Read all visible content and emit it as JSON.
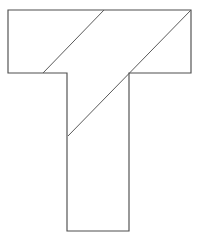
{
  "figure": {
    "canvas": {
      "width": 200,
      "height": 243,
      "background_color": "#ffffff"
    },
    "colors": {
      "outline_stroke": "#4f4f4f",
      "cut_stroke": "#5a5a5a",
      "fill": "#ffffff"
    },
    "outline": {
      "name": "t-polygon",
      "points": "8,10 191,10 191,73 129,73 129,231 67,231 67,73 8,73",
      "vertices": [
        [
          8,
          10
        ],
        [
          191,
          10
        ],
        [
          191,
          73
        ],
        [
          129,
          73
        ],
        [
          129,
          231
        ],
        [
          67,
          231
        ],
        [
          67,
          73
        ],
        [
          8,
          73
        ]
      ]
    },
    "cuts": [
      {
        "name": "diagonal-cut-short",
        "x1": 104,
        "y1": 10,
        "x2": 43,
        "y2": 73
      },
      {
        "name": "diagonal-cut-long",
        "x1": 191,
        "y1": 10,
        "x2": 68,
        "y2": 136
      }
    ]
  }
}
